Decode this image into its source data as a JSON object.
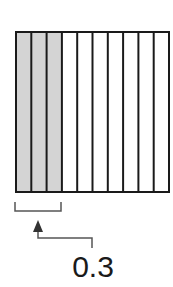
{
  "diagram": {
    "type": "decimal-grid",
    "total_columns": 10,
    "shaded_columns": 3,
    "shade_color": "#d4d4d4",
    "line_color": "#1a1a1a",
    "label": "0.3"
  }
}
